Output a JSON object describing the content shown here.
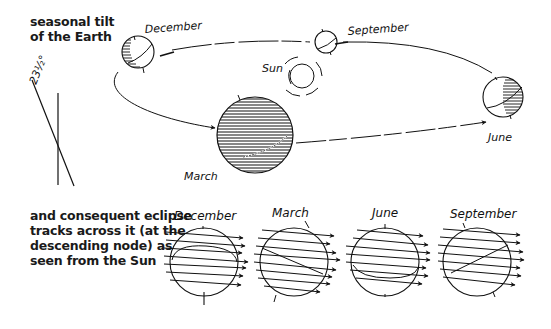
{
  "top_caption": {
    "line1": "seasonal tilt",
    "line2": "of the Earth"
  },
  "tilt_angle_label": "23½°",
  "orbit": {
    "sun_label": "Sun",
    "positions": [
      {
        "month": "December",
        "label": "December"
      },
      {
        "month": "September",
        "label": "September"
      },
      {
        "month": "June",
        "label": "June"
      },
      {
        "month": "March",
        "label": "March"
      }
    ]
  },
  "bottom_caption": {
    "line1": "and consequent eclipse",
    "line2": "tracks across it (at the",
    "line3": "descending node) as",
    "line4": "seen from the Sun"
  },
  "eclipse_tracks": [
    {
      "label": "December"
    },
    {
      "label": "March"
    },
    {
      "label": "June"
    },
    {
      "label": "September"
    }
  ],
  "colors": {
    "ink": "#111111",
    "background": "#ffffff"
  }
}
